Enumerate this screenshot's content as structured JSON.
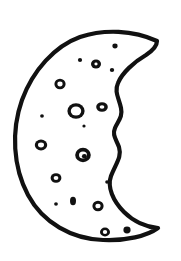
{
  "artwork": {
    "title": "Crescent Moon",
    "subject": "crescent-moon-with-craters",
    "medium": "hand-drawn ink line art",
    "background_color": "#ffffff",
    "ink_color": "#111111",
    "canvas": {
      "width": 181,
      "height": 261
    },
    "outline": {
      "stroke_color": "#111111",
      "stroke_width": 4.2,
      "fill_color": "#ffffff",
      "description": "Closed crescent silhouette: broad convex outer arc on the left, wavy concave inner arc on the right, joined at a pointed upper-right horn and a pointed lower-right horn.",
      "path": "M 157 41 C 133 30 104 29 80 37 C 55 46 33 70 22 100 C 11 131 13 167 28 195 C 43 223 72 239 103 240 C 126 241 147 236 158 228 C 146 227 133 221 124 212 C 113 201 107 187 111 176 C 116 163 122 157 119 147 C 116 139 112 135 115 128 C 118 121 123 117 121 108 C 119 98 114 92 118 83 C 122 73 134 62 146 55 C 152 51 157 47 157 41 Z",
      "outer_arc_extreme_x": 14,
      "upper_horn": [
        157,
        41
      ],
      "lower_horn": [
        159,
        229
      ]
    },
    "craters": [
      {
        "id": "crater-1",
        "cx": 115,
        "cy": 46,
        "rx": 2.6,
        "ry": 2.4,
        "style": "filled"
      },
      {
        "id": "crater-2",
        "cx": 80,
        "cy": 60,
        "rx": 2.1,
        "ry": 1.9,
        "style": "filled"
      },
      {
        "id": "crater-3",
        "cx": 96,
        "cy": 64,
        "rx": 5.0,
        "ry": 4.6,
        "style": "ring",
        "inner_rx": 1.6,
        "inner_ry": 1.4
      },
      {
        "id": "crater-4",
        "cx": 112,
        "cy": 70,
        "rx": 2.2,
        "ry": 2.0,
        "style": "filled"
      },
      {
        "id": "crater-5",
        "cx": 60,
        "cy": 84,
        "rx": 5.6,
        "ry": 5.2,
        "style": "ring",
        "inner_rx": 2.6,
        "inner_ry": 2.4
      },
      {
        "id": "crater-6",
        "cx": 76,
        "cy": 111,
        "rx": 8.6,
        "ry": 7.8,
        "style": "ring",
        "inner_rx": 5.2,
        "inner_ry": 4.6
      },
      {
        "id": "crater-7",
        "cx": 102,
        "cy": 107,
        "rx": 5.8,
        "ry": 4.8,
        "style": "ring",
        "inner_rx": 2.4,
        "inner_ry": 1.8
      },
      {
        "id": "crater-8",
        "cx": 42,
        "cy": 116,
        "rx": 1.9,
        "ry": 1.8,
        "style": "filled"
      },
      {
        "id": "crater-9",
        "cx": 41,
        "cy": 145,
        "rx": 6.2,
        "ry": 5.4,
        "style": "ring",
        "inner_rx": 3.0,
        "inner_ry": 2.4
      },
      {
        "id": "crater-10",
        "cx": 83,
        "cy": 155,
        "rx": 7.8,
        "ry": 7.2,
        "style": "ring-filled-core",
        "inner_rx": 4.0,
        "inner_ry": 3.6
      },
      {
        "id": "crater-11",
        "cx": 107,
        "cy": 182,
        "rx": 1.8,
        "ry": 1.7,
        "style": "filled"
      },
      {
        "id": "crater-12",
        "cx": 56,
        "cy": 178,
        "rx": 5.4,
        "ry": 4.8,
        "style": "ring",
        "inner_rx": 2.4,
        "inner_ry": 2.0
      },
      {
        "id": "crater-13",
        "cx": 56,
        "cy": 204,
        "rx": 1.9,
        "ry": 1.8,
        "style": "filled"
      },
      {
        "id": "crater-14",
        "cx": 73,
        "cy": 201,
        "rx": 3.0,
        "ry": 4.2,
        "style": "filled"
      },
      {
        "id": "crater-15",
        "cx": 98,
        "cy": 206,
        "rx": 5.6,
        "ry": 5.2,
        "style": "ring",
        "inner_rx": 2.6,
        "inner_ry": 2.3
      },
      {
        "id": "crater-16",
        "cx": 105,
        "cy": 232,
        "rx": 5.0,
        "ry": 4.4,
        "style": "ring",
        "inner_rx": 2.2,
        "inner_ry": 1.9
      },
      {
        "id": "crater-17",
        "cx": 127,
        "cy": 230,
        "rx": 3.6,
        "ry": 3.4,
        "style": "filled"
      },
      {
        "id": "crater-18",
        "cx": 84,
        "cy": 126,
        "rx": 1.6,
        "ry": 1.5,
        "style": "filled"
      }
    ]
  }
}
